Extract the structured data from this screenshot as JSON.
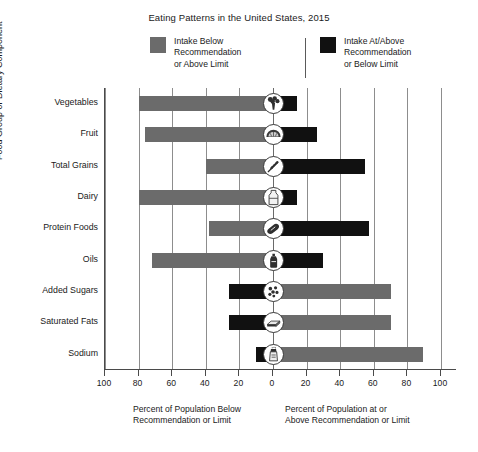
{
  "chart_data": {
    "type": "bar",
    "title": "Eating Patterns in the United States, 2015",
    "orientation": "horizontal-diverging",
    "categories": [
      "Vegetables",
      "Fruit",
      "Total Grains",
      "Dairy",
      "Protein Foods",
      "Oils",
      "Added Sugars",
      "Saturated Fats",
      "Sodium"
    ],
    "ylabel": "Food Group or Dietary Component",
    "xlabel_left": "Percent of Population Below\nRecommendation or Limit",
    "xlabel_right": "Percent of Population at or\nAbove Recommendation or Limit",
    "xlim": [
      -100,
      100
    ],
    "xticks": [
      -100,
      -80,
      -60,
      -40,
      -20,
      0,
      20,
      40,
      60,
      80,
      100
    ],
    "xticklabels": [
      "100",
      "80",
      "60",
      "40",
      "20",
      "0",
      "20",
      "40",
      "60",
      "80",
      "100"
    ],
    "grid": true,
    "legend_position": "top",
    "series": [
      {
        "name": "Intake Below Recommendation or Above Limit",
        "color": "#6b6b6b",
        "side": "varies",
        "values": [
          80,
          76,
          40,
          80,
          38,
          72,
          70,
          70,
          89
        ]
      },
      {
        "name": "Intake At/Above Recommendation or Below Limit",
        "color": "#111111",
        "side": "varies",
        "values": [
          14,
          26,
          55,
          14,
          57,
          30,
          26,
          26,
          10
        ]
      }
    ],
    "rows": [
      {
        "category": "Vegetables",
        "icon": "broccoli-icon",
        "left_value": 80,
        "left_color": "#6b6b6b",
        "right_value": 14,
        "right_color": "#111111"
      },
      {
        "category": "Fruit",
        "icon": "fruit-slice-icon",
        "left_value": 76,
        "left_color": "#6b6b6b",
        "right_value": 26,
        "right_color": "#111111"
      },
      {
        "category": "Total Grains",
        "icon": "grain-icon",
        "left_value": 40,
        "left_color": "#6b6b6b",
        "right_value": 55,
        "right_color": "#111111"
      },
      {
        "category": "Dairy",
        "icon": "dairy-icon",
        "left_value": 80,
        "left_color": "#6b6b6b",
        "right_value": 14,
        "right_color": "#111111"
      },
      {
        "category": "Protein Foods",
        "icon": "protein-icon",
        "left_value": 38,
        "left_color": "#6b6b6b",
        "right_value": 57,
        "right_color": "#111111"
      },
      {
        "category": "Oils",
        "icon": "oils-icon",
        "left_value": 72,
        "left_color": "#6b6b6b",
        "right_value": 30,
        "right_color": "#111111"
      },
      {
        "category": "Added Sugars",
        "icon": "added-sugars-icon",
        "left_value": 26,
        "left_color": "#111111",
        "right_value": 70,
        "right_color": "#6b6b6b"
      },
      {
        "category": "Saturated Fats",
        "icon": "saturated-fats-icon",
        "left_value": 26,
        "left_color": "#111111",
        "right_value": 70,
        "right_color": "#6b6b6b"
      },
      {
        "category": "Sodium",
        "icon": "sodium-icon",
        "left_value": 10,
        "left_color": "#111111",
        "right_value": 89,
        "right_color": "#6b6b6b"
      }
    ]
  },
  "legend": {
    "below": {
      "label": "Intake Below\nRecommendation\nor Above Limit",
      "color": "#6b6b6b"
    },
    "atabove": {
      "label": "Intake At/Above\nRecommendation\nor Below Limit",
      "color": "#111111"
    }
  }
}
